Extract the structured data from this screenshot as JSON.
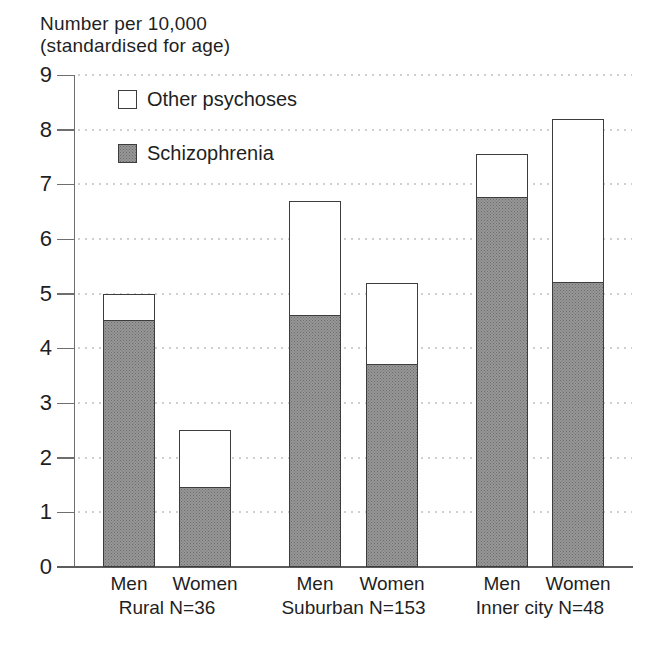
{
  "title": {
    "line1": "Number per 10,000",
    "line2": "(standardised for age)"
  },
  "legend": {
    "items": [
      {
        "label": "Other psychoses",
        "swatch": "white-open-square"
      },
      {
        "label": "Schizophrenia",
        "swatch": "halftone-gray-square"
      }
    ]
  },
  "colors": {
    "schizophrenia_fill": "#979797",
    "schizophrenia_dot": "#6d6d6d",
    "other_fill": "#ffffff",
    "bar_border": "#3d3d3d",
    "axis": "#6e6e6e",
    "grid": "#cfcfcf",
    "text": "#1f1f1f",
    "background": "#ffffff"
  },
  "chart_data": {
    "type": "bar",
    "stacked": true,
    "title": "Number per 10,000 (standardised for age)",
    "xlabel": "",
    "ylabel": "Number per 10,000 (standardised for age)",
    "ylim": [
      0,
      9
    ],
    "yticks": [
      0,
      1,
      2,
      3,
      4,
      5,
      6,
      7,
      8,
      9
    ],
    "grid": "horizontal-dotted",
    "legend_position": "top-left-inside",
    "categories": [
      "Men",
      "Women",
      "Men",
      "Women",
      "Men",
      "Women"
    ],
    "group_labels": [
      "Rural N=36",
      "Suburban N=153",
      "Inner city N=48"
    ],
    "series": [
      {
        "name": "Schizophrenia",
        "values": [
          4.5,
          1.45,
          4.6,
          3.7,
          6.75,
          5.2
        ]
      },
      {
        "name": "Other psychoses",
        "values": [
          0.5,
          1.05,
          2.1,
          1.5,
          0.8,
          3.0
        ]
      }
    ],
    "totals": [
      5.0,
      2.5,
      6.7,
      5.2,
      7.55,
      8.2
    ],
    "groups": [
      {
        "label": "Rural N=36",
        "bars": [
          {
            "label": "Men",
            "schizophrenia": 4.5,
            "other_psychoses": 0.5,
            "total": 5.0
          },
          {
            "label": "Women",
            "schizophrenia": 1.45,
            "other_psychoses": 1.05,
            "total": 2.5
          }
        ]
      },
      {
        "label": "Suburban N=153",
        "bars": [
          {
            "label": "Men",
            "schizophrenia": 4.6,
            "other_psychoses": 2.1,
            "total": 6.7
          },
          {
            "label": "Women",
            "schizophrenia": 3.7,
            "other_psychoses": 1.5,
            "total": 5.2
          }
        ]
      },
      {
        "label": "Inner city N=48",
        "bars": [
          {
            "label": "Men",
            "schizophrenia": 6.75,
            "other_psychoses": 0.8,
            "total": 7.55
          },
          {
            "label": "Women",
            "schizophrenia": 5.2,
            "other_psychoses": 3.0,
            "total": 8.2
          }
        ]
      }
    ]
  }
}
